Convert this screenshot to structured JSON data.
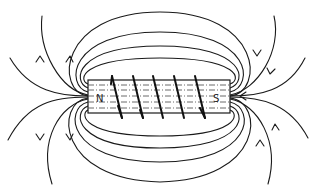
{
  "diagram": {
    "poles": {
      "north_label": "N",
      "south_label": "S"
    },
    "coil_turns": 5,
    "colors": {
      "background": "#ffffff",
      "ink": "#1a1a1a"
    }
  }
}
